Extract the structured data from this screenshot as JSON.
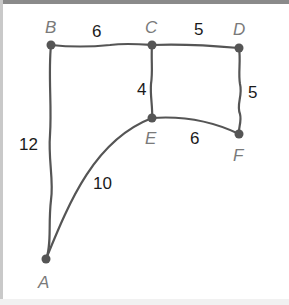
{
  "diagram": {
    "type": "weighted-graph",
    "colors": {
      "edge": "#555555",
      "node": "#555555",
      "node_label": "#7a7a7a",
      "weight_label": "#1a1a1a",
      "frame_top": "#8a8a8a"
    },
    "nodes": [
      {
        "id": "A",
        "label": "A"
      },
      {
        "id": "B",
        "label": "B"
      },
      {
        "id": "C",
        "label": "C"
      },
      {
        "id": "D",
        "label": "D"
      },
      {
        "id": "E",
        "label": "E"
      },
      {
        "id": "F",
        "label": "F"
      }
    ],
    "edges": [
      {
        "from": "B",
        "to": "C",
        "weight": "6"
      },
      {
        "from": "C",
        "to": "D",
        "weight": "5"
      },
      {
        "from": "C",
        "to": "E",
        "weight": "4"
      },
      {
        "from": "D",
        "to": "F",
        "weight": "5"
      },
      {
        "from": "E",
        "to": "F",
        "weight": "6"
      },
      {
        "from": "B",
        "to": "A",
        "weight": "12"
      },
      {
        "from": "A",
        "to": "E",
        "weight": "10"
      }
    ]
  }
}
